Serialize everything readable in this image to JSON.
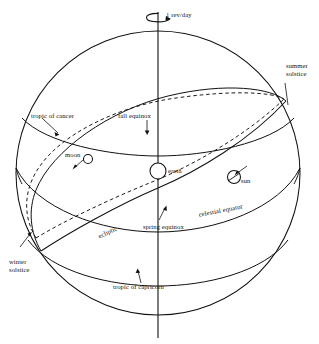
{
  "figure": {
    "type": "astronomy-diagram",
    "background_color": "#ffffff",
    "line_color": "#111111"
  },
  "labels": {
    "rotation_rate": "1 rev/day",
    "summer_solstice": "summer solstice",
    "winter_solstice": "winter solstice",
    "spring_equinox": "spring equinox",
    "fall_equinox": "fall equinox",
    "tropic_of_cancer": "tropic of cancer",
    "tropic_of_capricorn": "tropic of capricorn",
    "celestial_equator": "celestial equator",
    "ecliptic": "ecliptic",
    "earth": "earth",
    "sun": "sun",
    "moon": "moon"
  },
  "bodies": [
    {
      "name": "earth",
      "label": "earth",
      "cx": 158,
      "cy": 171,
      "r": 8
    },
    {
      "name": "sun",
      "label": "sun",
      "cx": 234,
      "cy": 177,
      "r": 6.5
    },
    {
      "name": "moon",
      "label": "moon",
      "cx": 88,
      "cy": 159,
      "r": 4.5
    }
  ],
  "sphere": {
    "cx": 158,
    "cy": 173,
    "r": 142
  },
  "curves": {
    "celestial_equator": {
      "style": "solid",
      "description": "great circle in sphere equatorial plane"
    },
    "ecliptic": {
      "style": "solid",
      "description": "great circle tilted 23.5 degrees to celestial equator"
    },
    "moon_orbit": {
      "style": "dashed",
      "description": "great circle tilted about 5 degrees to the ecliptic"
    },
    "tropic_of_cancer": {
      "style": "solid",
      "description": "small circle north of celestial equator"
    },
    "tropic_of_capricorn": {
      "style": "solid",
      "description": "small circle south of celestial equator"
    },
    "rotation_axis": {
      "style": "solid",
      "description": "vertical polar axis with rotation arrow"
    }
  }
}
